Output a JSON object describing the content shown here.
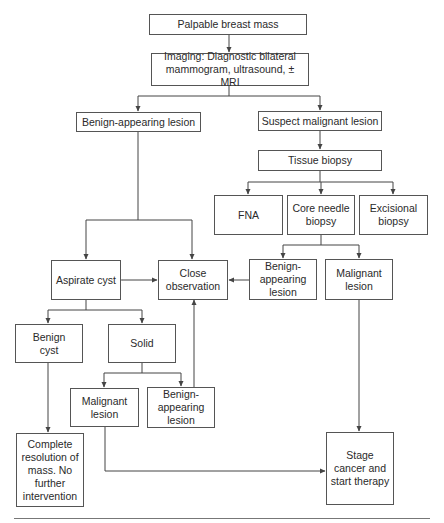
{
  "diagram": {
    "colors": {
      "line": "#444444",
      "box_border": "#555555",
      "text": "#2a2a2a",
      "background": "#ffffff"
    },
    "nodes": {
      "palpable_mass": "Palpable breast mass",
      "imaging": "Imaging: Diagnostic bilateral mammogram, ultrasound, ± MRI",
      "benign_appearing": "Benign-appearing lesion",
      "suspect_malignant": "Suspect malignant lesion",
      "tissue_biopsy": "Tissue biopsy",
      "fna": "FNA",
      "core_needle": "Core needle biopsy",
      "excisional": "Excisional biopsy",
      "aspirate_cyst": "Aspirate cyst",
      "close_observation": "Close observation",
      "biopsy_benign": "Benign-appearing lesion",
      "biopsy_malignant": "Malignant lesion",
      "benign_cyst": "Benign cyst",
      "solid": "Solid",
      "solid_malignant": "Malignant lesion",
      "solid_benign": "Benign-appearing lesion",
      "complete_resolution": "Complete resolution of mass. No further intervention",
      "stage_cancer": "Stage cancer and start therapy"
    },
    "edges": [
      {
        "from": "palpable_mass",
        "to": "imaging"
      },
      {
        "from": "imaging",
        "to": "benign_appearing"
      },
      {
        "from": "imaging",
        "to": "suspect_malignant"
      },
      {
        "from": "benign_appearing",
        "to": "aspirate_cyst"
      },
      {
        "from": "benign_appearing",
        "to": "close_observation"
      },
      {
        "from": "suspect_malignant",
        "to": "tissue_biopsy"
      },
      {
        "from": "tissue_biopsy",
        "to": "fna"
      },
      {
        "from": "tissue_biopsy",
        "to": "core_needle"
      },
      {
        "from": "tissue_biopsy",
        "to": "excisional"
      },
      {
        "from": "core_needle",
        "to": "biopsy_benign"
      },
      {
        "from": "core_needle",
        "to": "biopsy_malignant"
      },
      {
        "from": "biopsy_benign",
        "to": "close_observation"
      },
      {
        "from": "aspirate_cyst",
        "to": "close_observation",
        "bidirectional": true
      },
      {
        "from": "aspirate_cyst",
        "to": "benign_cyst"
      },
      {
        "from": "aspirate_cyst",
        "to": "solid"
      },
      {
        "from": "solid",
        "to": "solid_malignant"
      },
      {
        "from": "solid",
        "to": "solid_benign"
      },
      {
        "from": "solid_benign",
        "to": "close_observation"
      },
      {
        "from": "benign_cyst",
        "to": "complete_resolution"
      },
      {
        "from": "biopsy_malignant",
        "to": "stage_cancer"
      },
      {
        "from": "solid_malignant",
        "to": "stage_cancer"
      }
    ]
  }
}
